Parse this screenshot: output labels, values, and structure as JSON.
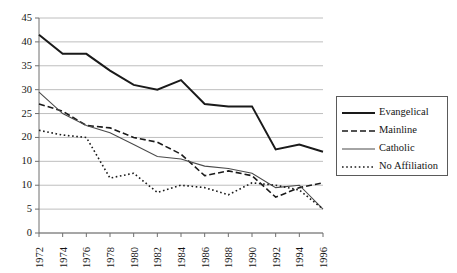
{
  "chart_data": {
    "type": "line",
    "title": "",
    "subtitle": "",
    "xlabel": "",
    "ylabel": "",
    "grid": true,
    "legend_position": "right",
    "xlim": [
      1972,
      1996
    ],
    "ylim": [
      0,
      45
    ],
    "x": [
      1972,
      1974,
      1976,
      1978,
      1980,
      1982,
      1984,
      1986,
      1988,
      1990,
      1992,
      1994,
      1996
    ],
    "x_tick_labels": [
      "1972",
      "1974",
      "1976",
      "1978",
      "1980",
      "1982",
      "1984",
      "1986",
      "1988",
      "1990",
      "1992",
      "1994",
      "1996"
    ],
    "y_ticks": [
      0,
      5,
      10,
      15,
      20,
      25,
      30,
      35,
      40,
      45
    ],
    "y_tick_labels": [
      "0",
      "5",
      "10",
      "10",
      "20",
      "25",
      "30",
      "35",
      "40",
      "45"
    ],
    "series": [
      {
        "name": "Evangelical",
        "style": "solid-thick",
        "color": "#1a1a1a",
        "values": [
          41.5,
          37.5,
          37.5,
          34.0,
          31.0,
          30.0,
          32.0,
          27.0,
          26.5,
          26.5,
          17.5,
          18.5,
          17.0
        ]
      },
      {
        "name": "Mainline",
        "style": "dashed",
        "color": "#1a1a1a",
        "values": [
          27.0,
          25.5,
          22.5,
          22.0,
          20.0,
          19.0,
          16.5,
          12.0,
          13.0,
          12.0,
          7.5,
          9.5,
          10.5
        ]
      },
      {
        "name": "Catholic",
        "style": "solid-thin",
        "color": "#4a4a4a",
        "values": [
          29.5,
          25.0,
          22.5,
          21.0,
          18.5,
          16.0,
          15.5,
          14.0,
          13.5,
          12.5,
          9.5,
          10.0,
          5.0
        ]
      },
      {
        "name": "No Affiliation",
        "style": "dotted",
        "color": "#1a1a1a",
        "values": [
          21.5,
          20.5,
          20.0,
          11.5,
          12.5,
          8.5,
          10.0,
          9.5,
          8.0,
          10.5,
          10.0,
          9.0,
          5.0
        ]
      }
    ]
  },
  "legend": {
    "items": [
      {
        "label": "Evangelical"
      },
      {
        "label": "Mainline"
      },
      {
        "label": "Catholic"
      },
      {
        "label": "No Affiliation"
      }
    ]
  },
  "colors": {
    "gridline": "#b7b7b7",
    "axis": "#6f6f6f",
    "text": "#141414",
    "background": "#ffffff"
  }
}
